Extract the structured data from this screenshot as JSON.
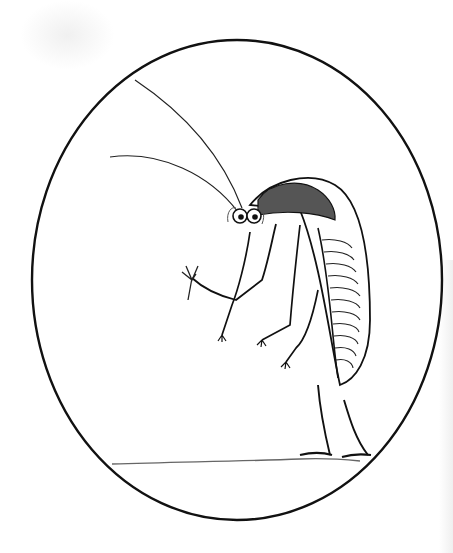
{
  "illustration": {
    "subject": "cockroach-like insect sketch",
    "frame": "oval",
    "colors": {
      "background": "#ffffff",
      "ink": "#111111",
      "shading": "#555555"
    }
  }
}
